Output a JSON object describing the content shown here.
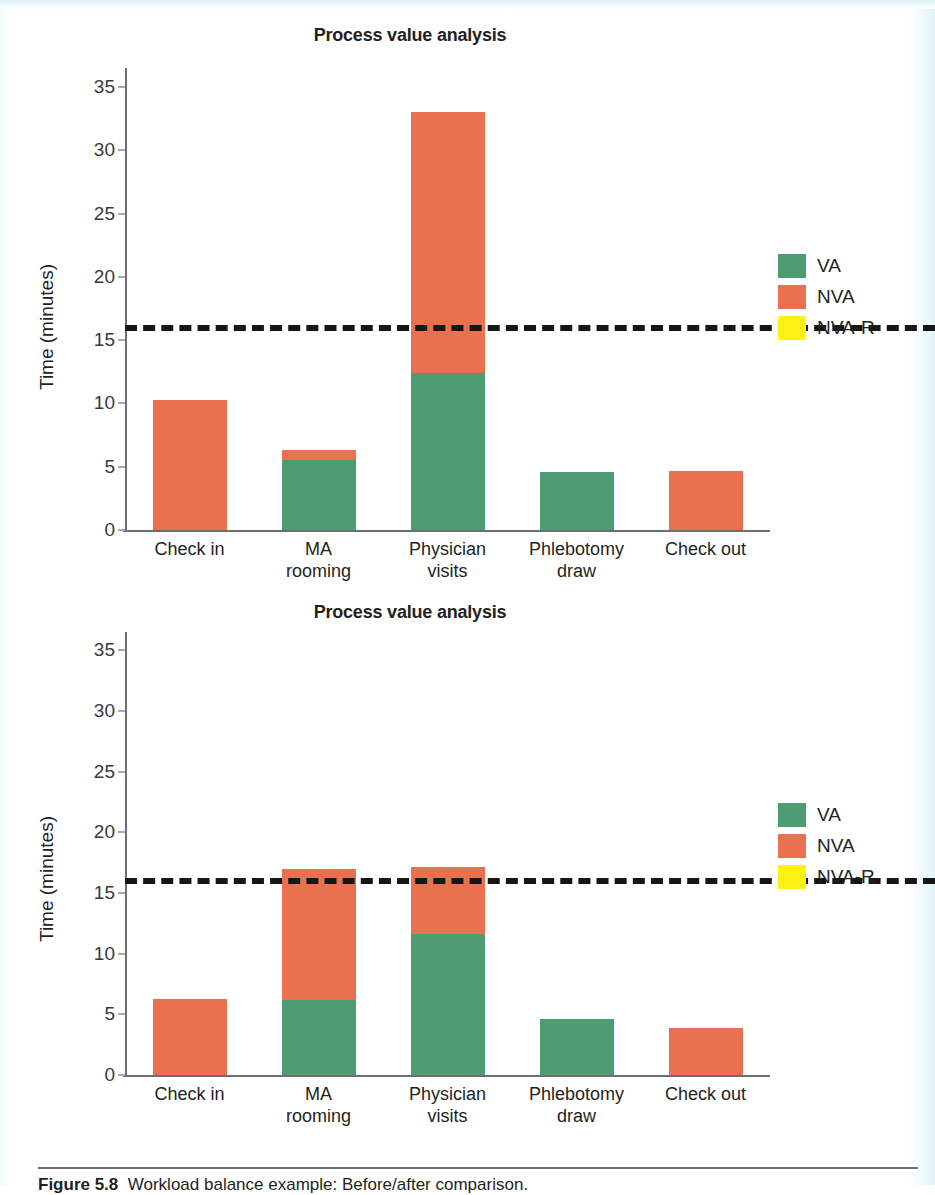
{
  "page": {
    "background_color": "#ffffff",
    "scan_tint_color": "#e0f4f7"
  },
  "colors": {
    "va": "#4e9c71",
    "nva": "#e9714f",
    "nva_r": "#fdf012",
    "takt_line": "#161616",
    "axis": "#6d6e71",
    "text": "#231f20"
  },
  "legend": {
    "items": [
      {
        "label": "VA",
        "color": "#4e9c71"
      },
      {
        "label": "NVA",
        "color": "#e9714f"
      },
      {
        "label": "NVA-R",
        "color": "#fdf012"
      }
    ]
  },
  "caption": {
    "number": "Figure 5.8",
    "text": "Workload balance example: Before/after comparison."
  },
  "chart_data": [
    {
      "id": "before",
      "type": "bar",
      "stacked": true,
      "title": "Process value analysis",
      "xlabel": "",
      "ylabel": "Time (minutes)",
      "ylim": [
        0,
        36.5
      ],
      "yticks": [
        0,
        5,
        10,
        15,
        20,
        25,
        30,
        35
      ],
      "ytick_labels": [
        "0",
        "5",
        "10",
        "15",
        "20",
        "25",
        "30",
        "35"
      ],
      "grid": false,
      "legend_position": "right",
      "categories": [
        "Check in",
        "MA rooming",
        "Physician visits",
        "Phlebotomy draw",
        "Check out"
      ],
      "series": [
        {
          "name": "VA",
          "color": "#4e9c71",
          "values": [
            0,
            5.5,
            12.4,
            4.6,
            0
          ]
        },
        {
          "name": "NVA",
          "color": "#e9714f",
          "values": [
            10.3,
            0.8,
            20.6,
            0,
            4.7
          ]
        },
        {
          "name": "NVA-R",
          "color": "#fdf012",
          "values": [
            0,
            0,
            0,
            0,
            0
          ]
        }
      ],
      "totals": [
        10.3,
        6.3,
        33.0,
        4.6,
        4.7
      ],
      "annotations": [
        {
          "type": "hline",
          "name": "takt-time-line",
          "value": 16.2,
          "style": "dashed",
          "color": "#161616"
        }
      ]
    },
    {
      "id": "after",
      "type": "bar",
      "stacked": true,
      "title": "Process value analysis",
      "xlabel": "",
      "ylabel": "Time (minutes)",
      "ylim": [
        0,
        36.5
      ],
      "yticks": [
        0,
        5,
        10,
        15,
        20,
        25,
        30,
        35
      ],
      "ytick_labels": [
        "0",
        "5",
        "10",
        "15",
        "20",
        "25",
        "30",
        "35"
      ],
      "grid": false,
      "legend_position": "right",
      "categories": [
        "Check in",
        "MA rooming",
        "Physician visits",
        "Phlebotomy draw",
        "Check out"
      ],
      "series": [
        {
          "name": "VA",
          "color": "#4e9c71",
          "values": [
            0,
            6.2,
            11.6,
            4.6,
            0
          ]
        },
        {
          "name": "NVA",
          "color": "#e9714f",
          "values": [
            6.3,
            10.8,
            5.5,
            0,
            3.9
          ]
        },
        {
          "name": "NVA-R",
          "color": "#fdf012",
          "values": [
            0,
            0,
            0,
            0,
            0
          ]
        }
      ],
      "totals": [
        6.3,
        17.0,
        17.1,
        4.6,
        3.9
      ],
      "annotations": [
        {
          "type": "hline",
          "name": "takt-time-line",
          "value": 16.2,
          "style": "dashed",
          "color": "#161616"
        }
      ]
    }
  ]
}
